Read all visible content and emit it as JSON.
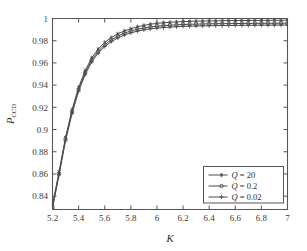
{
  "chart_data": {
    "type": "line",
    "title": "",
    "xlabel": "K",
    "ylabel": "P_CCD",
    "ylabel_main": "P",
    "ylabel_sub": "CCD",
    "xlim": [
      5.2,
      7.0
    ],
    "ylim": [
      0.828,
      1.0
    ],
    "grid": false,
    "legend_position": "lower right",
    "xticks": [
      "5.2",
      "5.4",
      "5.6",
      "5.8",
      "6",
      "6.2",
      "6.4",
      "6.6",
      "6.8",
      "7"
    ],
    "xtick_values": [
      5.2,
      5.4,
      5.6,
      5.8,
      6.0,
      6.2,
      6.4,
      6.6,
      6.8,
      7.0
    ],
    "yticks": [
      "0.84",
      "0.86",
      "0.88",
      "0.9",
      "0.92",
      "0.94",
      "0.96",
      "0.98",
      "1"
    ],
    "ytick_values": [
      0.84,
      0.86,
      0.88,
      0.9,
      0.92,
      0.94,
      0.96,
      0.98,
      1.0
    ],
    "x": [
      5.2,
      5.25,
      5.3,
      5.35,
      5.4,
      5.45,
      5.5,
      5.55,
      5.6,
      5.65,
      5.7,
      5.75,
      5.8,
      5.85,
      5.9,
      5.95,
      6.0,
      6.05,
      6.1,
      6.15,
      6.2,
      6.25,
      6.3,
      6.35,
      6.4,
      6.45,
      6.5,
      6.55,
      6.6,
      6.65,
      6.7,
      6.75,
      6.8,
      6.85,
      6.9,
      6.95,
      7.0
    ],
    "series": [
      {
        "name": "Q = 20",
        "label_var": "Q",
        "label_value": "20",
        "marker": "star",
        "values": [
          0.832,
          0.862,
          0.893,
          0.918,
          0.938,
          0.953,
          0.9645,
          0.9725,
          0.9785,
          0.9828,
          0.9862,
          0.9888,
          0.9908,
          0.9925,
          0.9938,
          0.9948,
          0.9956,
          0.9962,
          0.9966,
          0.9969,
          0.9972,
          0.9974,
          0.9976,
          0.9977,
          0.9978,
          0.9979,
          0.998,
          0.9981,
          0.9981,
          0.9982,
          0.9982,
          0.9983,
          0.9983,
          0.9983,
          0.9984,
          0.9984,
          0.9984
        ]
      },
      {
        "name": "Q = 0.2",
        "label_var": "Q",
        "label_value": "0.2",
        "marker": "circle",
        "values": [
          0.8305,
          0.8605,
          0.8915,
          0.9162,
          0.9362,
          0.9512,
          0.9625,
          0.9705,
          0.9765,
          0.9808,
          0.9842,
          0.9868,
          0.9888,
          0.9903,
          0.9915,
          0.9924,
          0.9931,
          0.9936,
          0.994,
          0.9943,
          0.9946,
          0.9948,
          0.9949,
          0.9951,
          0.9952,
          0.9953,
          0.9954,
          0.9954,
          0.9955,
          0.9955,
          0.9956,
          0.9956,
          0.9957,
          0.9957,
          0.9957,
          0.9958,
          0.9958
        ]
      },
      {
        "name": "Q = 0.02",
        "label_var": "Q",
        "label_value": "0.02",
        "marker": "plus",
        "values": [
          0.829,
          0.859,
          0.8898,
          0.9145,
          0.9345,
          0.9495,
          0.9608,
          0.9688,
          0.9748,
          0.9791,
          0.9825,
          0.9851,
          0.9871,
          0.9886,
          0.9898,
          0.9907,
          0.9914,
          0.9919,
          0.9923,
          0.9926,
          0.9929,
          0.9931,
          0.9932,
          0.9934,
          0.9935,
          0.9936,
          0.9937,
          0.9937,
          0.9938,
          0.9938,
          0.9939,
          0.9939,
          0.994,
          0.994,
          0.994,
          0.9941,
          0.9941
        ]
      }
    ]
  },
  "colors": {
    "background": "#ffffff",
    "axis": "#555555",
    "curve": "#4a4a4a",
    "text": "#2b2b2b"
  },
  "legend": {
    "entries": [
      {
        "var": "Q",
        "eq": "=",
        "value": "20"
      },
      {
        "var": "Q",
        "eq": "=",
        "value": "0.2"
      },
      {
        "var": "Q",
        "eq": "=",
        "value": "0.02"
      }
    ]
  }
}
